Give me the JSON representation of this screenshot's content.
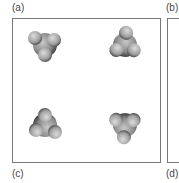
{
  "figure": {
    "labels": [
      "(a)",
      "(b)",
      "(c)",
      "(d)"
    ],
    "panel_a": {
      "molecules": [
        {
          "name": "molecule-top-left",
          "cx": 45,
          "cy": 45,
          "rotation": 0
        },
        {
          "name": "molecule-top-right",
          "cx": 125,
          "cy": 45,
          "rotation": 60
        },
        {
          "name": "molecule-bottom-left",
          "cx": 45,
          "cy": 125,
          "rotation": 180
        },
        {
          "name": "molecule-bottom-right",
          "cx": 125,
          "cy": 125,
          "rotation": 240
        }
      ]
    },
    "colors": {
      "border": "#777777",
      "sphere_dark": "#5a5a5a",
      "sphere_light": "#bdbdbd"
    }
  }
}
